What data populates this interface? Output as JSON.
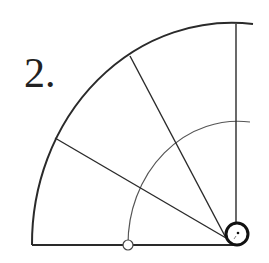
{
  "figure": {
    "label": "2.",
    "stroke_color": "#2a2a2a",
    "background": "#ffffff"
  }
}
